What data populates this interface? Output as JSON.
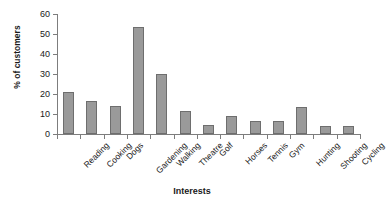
{
  "chart_data": {
    "type": "bar",
    "title": "",
    "subtitle": "",
    "xlabel": "Interests",
    "ylabel": "% of customers",
    "categories": [
      "Reading",
      "Cooking",
      "Dogs",
      "Gardening",
      "Walking",
      "Theatre",
      "Golf",
      "Horses",
      "Tennis",
      "Gym",
      "Hunting",
      "Shooting",
      "Cycling"
    ],
    "values": [
      21,
      16.5,
      14,
      53.5,
      30,
      11.5,
      4.5,
      9,
      6.5,
      6.5,
      13.5,
      4,
      4
    ],
    "ylim": [
      0,
      60
    ],
    "yticks": [
      0,
      10,
      20,
      30,
      40,
      50,
      60
    ],
    "ytick_labels": [
      "0",
      "10",
      "20",
      "30",
      "40",
      "50",
      "60"
    ],
    "grid": false,
    "legend": false,
    "legend_position": "none",
    "bar_color": "#9a9a9a",
    "bar_border_color": "#6e6e6e",
    "axis_color": "#7d7d7d",
    "background_color": "#ffffff",
    "xlabel_rotation": -45
  }
}
